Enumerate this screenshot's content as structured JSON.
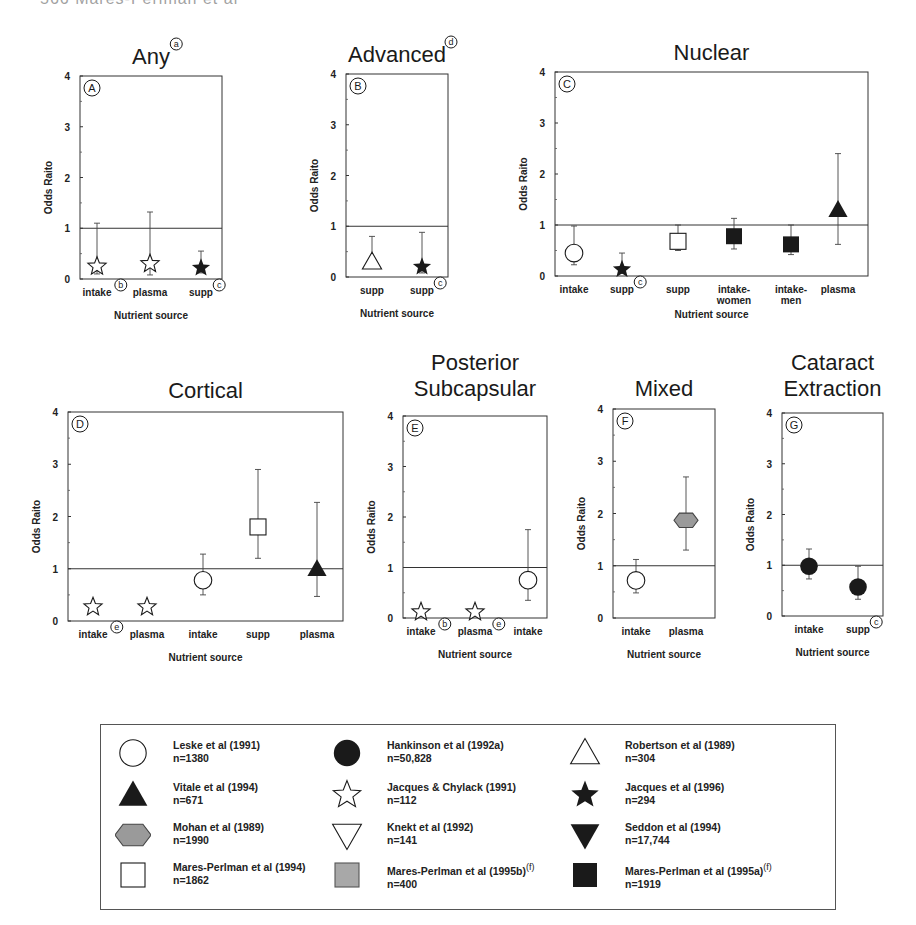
{
  "header": {
    "text": "566          Mares-Perlman et al"
  },
  "axis": {
    "ylabel": "Odds Raito",
    "xlabel": "Nutrient source",
    "yticks": [
      0,
      1,
      2,
      3,
      4
    ],
    "reference_line": 1
  },
  "colors": {
    "ink": "#1a1a1a",
    "hexagon_fill": "#9a9a9a",
    "gray_square_fill": "#a8a8a8"
  },
  "panels": [
    {
      "id": "A",
      "title": "Any",
      "title_note": "a",
      "frame": [
        80,
        76,
        222,
        279
      ],
      "show_xlabel": true,
      "points": [
        {
          "x": 97,
          "label": "intake",
          "label_note": "b",
          "marker": "star-open",
          "or": 0.25,
          "lo": 0.1,
          "hi": 1.1
        },
        {
          "x": 150,
          "label": "plasma",
          "marker": "star-open",
          "or": 0.3,
          "lo": 0.08,
          "hi": 1.32
        },
        {
          "x": 201,
          "label": "supp",
          "label_note": "c",
          "marker": "star-filled",
          "or": 0.22,
          "lo": 0.12,
          "hi": 0.55
        }
      ]
    },
    {
      "id": "B",
      "title": "Advanced",
      "title_note": "d",
      "frame": [
        346,
        74,
        448,
        277
      ],
      "show_xlabel": true,
      "points": [
        {
          "x": 372,
          "label": "supp",
          "marker": "triangle-open",
          "or": 0.3,
          "lo": 0.25,
          "hi": 0.8
        },
        {
          "x": 422,
          "label": "supp",
          "label_note": "c",
          "marker": "star-filled",
          "or": 0.2,
          "lo": 0.08,
          "hi": 0.88
        }
      ]
    },
    {
      "id": "C",
      "title": "Nuclear",
      "title_note": "",
      "frame": [
        555,
        72,
        868,
        276
      ],
      "show_xlabel": true,
      "points": [
        {
          "x": 574,
          "label": "intake",
          "marker": "circle-open",
          "or": 0.45,
          "lo": 0.22,
          "hi": 0.98
        },
        {
          "x": 622,
          "label": "supp",
          "label_note": "c",
          "marker": "star-filled",
          "or": 0.13,
          "lo": 0.05,
          "hi": 0.45
        },
        {
          "x": 678,
          "label": "supp",
          "marker": "square-open",
          "or": 0.68,
          "lo": 0.5,
          "hi": 1.0
        },
        {
          "x": 734,
          "label": "intake-women",
          "marker": "square-filled",
          "or": 0.78,
          "lo": 0.53,
          "hi": 1.13
        },
        {
          "x": 791,
          "label": "intake-men",
          "marker": "square-filled",
          "or": 0.62,
          "lo": 0.42,
          "hi": 1.0
        },
        {
          "x": 838,
          "label": "plasma",
          "marker": "triangle-filled",
          "or": 1.3,
          "lo": 0.62,
          "hi": 2.4
        }
      ]
    },
    {
      "id": "D",
      "title": "Cortical",
      "title_note": "",
      "frame": [
        68,
        412,
        343,
        621
      ],
      "show_xlabel": true,
      "points": [
        {
          "x": 93,
          "label": "intake",
          "label_note": "e",
          "marker": "star-open",
          "or": 0.27,
          "lo": null,
          "hi": null
        },
        {
          "x": 147,
          "label": "plasma",
          "marker": "star-open",
          "or": 0.27,
          "lo": null,
          "hi": null
        },
        {
          "x": 203,
          "label": "intake",
          "marker": "circle-open",
          "or": 0.78,
          "lo": 0.5,
          "hi": 1.28
        },
        {
          "x": 258,
          "label": "supp",
          "marker": "square-open",
          "or": 1.8,
          "lo": 1.2,
          "hi": 2.9
        },
        {
          "x": 317,
          "label": "plasma",
          "marker": "triangle-filled",
          "or": 1.0,
          "lo": 0.47,
          "hi": 2.27
        }
      ]
    },
    {
      "id": "E",
      "title": "Posterior Subcapsular",
      "title_note": "",
      "frame": [
        403,
        416,
        547,
        618
      ],
      "show_xlabel": true,
      "points": [
        {
          "x": 421,
          "label": "intake",
          "label_note": "b",
          "marker": "star-open",
          "or": 0.12,
          "lo": null,
          "hi": null
        },
        {
          "x": 475,
          "label": "plasma",
          "label_note": "e",
          "marker": "star-open",
          "or": 0.12,
          "lo": null,
          "hi": null
        },
        {
          "x": 528,
          "label": "intake",
          "marker": "circle-open",
          "or": 0.75,
          "lo": 0.35,
          "hi": 1.75
        }
      ]
    },
    {
      "id": "F",
      "title": "Mixed",
      "title_note": "",
      "frame": [
        613,
        409,
        715,
        618
      ],
      "show_xlabel": true,
      "points": [
        {
          "x": 636,
          "label": "intake",
          "marker": "circle-open",
          "or": 0.72,
          "lo": 0.48,
          "hi": 1.12
        },
        {
          "x": 686,
          "label": "plasma",
          "marker": "hexagon-gray",
          "or": 1.87,
          "lo": 1.3,
          "hi": 2.7
        }
      ]
    },
    {
      "id": "G",
      "title": "Cataract Extraction",
      "title_note": "",
      "frame": [
        782,
        413,
        883,
        616
      ],
      "show_xlabel": true,
      "points": [
        {
          "x": 809,
          "label": "intake",
          "marker": "circle-filled",
          "or": 0.98,
          "lo": 0.73,
          "hi": 1.32
        },
        {
          "x": 858,
          "label": "supp",
          "label_note": "c",
          "marker": "circle-filled",
          "or": 0.57,
          "lo": 0.33,
          "hi": 0.98
        }
      ]
    }
  ],
  "legend": {
    "items": [
      {
        "marker": "circle-open",
        "name": "Leske et al (1991)",
        "n": "n=1380",
        "note": ""
      },
      {
        "marker": "triangle-filled",
        "name": "Vitale et al (1994)",
        "n": "n=671",
        "note": ""
      },
      {
        "marker": "hexagon-gray",
        "name": "Mohan et al (1989)",
        "n": "n=1990",
        "note": ""
      },
      {
        "marker": "square-open",
        "name": "Mares-Perlman et al (1994)",
        "n": "n=1862",
        "note": ""
      },
      {
        "marker": "circle-filled",
        "name": "Hankinson et al (1992a)",
        "n": "n=50,828",
        "note": ""
      },
      {
        "marker": "star-open",
        "name": "Jacques & Chylack (1991)",
        "n": "n=112",
        "note": ""
      },
      {
        "marker": "triangle-down-open",
        "name": "Knekt et al (1992)",
        "n": "n=141",
        "note": ""
      },
      {
        "marker": "square-gray",
        "name": "Mares-Perlman et al (1995b)",
        "n": "n=400",
        "note": "f"
      },
      {
        "marker": "triangle-open",
        "name": "Robertson et al (1989)",
        "n": "n=304",
        "note": ""
      },
      {
        "marker": "star-filled",
        "name": "Jacques et al (1996)",
        "n": "n=294",
        "note": ""
      },
      {
        "marker": "triangle-down-filled",
        "name": "Seddon et al (1994)",
        "n": "n=17,744",
        "note": ""
      },
      {
        "marker": "square-filled",
        "name": "Mares-Perlman et al (1995a)",
        "n": "n=1919",
        "note": "f"
      }
    ]
  },
  "chart_data": {
    "type": "scatter",
    "ylabel": "Odds Raito",
    "xlabel": "Nutrient source",
    "ylim": [
      0,
      4
    ],
    "reference_line": 1,
    "panels": [
      {
        "panel": "A",
        "title": "Any",
        "categories": [
          "intake",
          "plasma",
          "supp"
        ],
        "values": [
          0.25,
          0.3,
          0.22
        ],
        "ci_low": [
          0.1,
          0.08,
          0.12
        ],
        "ci_high": [
          1.1,
          1.32,
          0.55
        ],
        "studies": [
          "Jacques & Chylack (1991)",
          "Jacques & Chylack (1991)",
          "Jacques et al (1996)"
        ]
      },
      {
        "panel": "B",
        "title": "Advanced",
        "categories": [
          "supp",
          "supp"
        ],
        "values": [
          0.3,
          0.2
        ],
        "ci_low": [
          0.25,
          0.08
        ],
        "ci_high": [
          0.8,
          0.88
        ],
        "studies": [
          "Robertson et al (1989)",
          "Jacques et al (1996)"
        ]
      },
      {
        "panel": "C",
        "title": "Nuclear",
        "categories": [
          "intake",
          "supp",
          "supp",
          "intake-women",
          "intake-men",
          "plasma"
        ],
        "values": [
          0.45,
          0.13,
          0.68,
          0.78,
          0.62,
          1.3
        ],
        "ci_low": [
          0.22,
          0.05,
          0.5,
          0.53,
          0.42,
          0.62
        ],
        "ci_high": [
          0.98,
          0.45,
          1.0,
          1.13,
          1.0,
          2.4
        ],
        "studies": [
          "Leske et al (1991)",
          "Jacques et al (1996)",
          "Mares-Perlman et al (1994)",
          "Mares-Perlman et al (1995a)",
          "Mares-Perlman et al (1995a)",
          "Vitale et al (1994)"
        ]
      },
      {
        "panel": "D",
        "title": "Cortical",
        "categories": [
          "intake",
          "plasma",
          "intake",
          "supp",
          "plasma"
        ],
        "values": [
          0.27,
          0.27,
          0.78,
          1.8,
          1.0
        ],
        "ci_low": [
          null,
          null,
          0.5,
          1.2,
          0.47
        ],
        "ci_high": [
          null,
          null,
          1.28,
          2.9,
          2.27
        ],
        "studies": [
          "Jacques & Chylack (1991)",
          "Jacques & Chylack (1991)",
          "Leske et al (1991)",
          "Mares-Perlman et al (1994)",
          "Vitale et al (1994)"
        ]
      },
      {
        "panel": "E",
        "title": "Posterior Subcapsular",
        "categories": [
          "intake",
          "plasma",
          "intake"
        ],
        "values": [
          0.12,
          0.12,
          0.75
        ],
        "ci_low": [
          null,
          null,
          0.35
        ],
        "ci_high": [
          null,
          null,
          1.75
        ],
        "studies": [
          "Jacques & Chylack (1991)",
          "Jacques & Chylack (1991)",
          "Leske et al (1991)"
        ]
      },
      {
        "panel": "F",
        "title": "Mixed",
        "categories": [
          "intake",
          "plasma"
        ],
        "values": [
          0.72,
          1.87
        ],
        "ci_low": [
          0.48,
          1.3
        ],
        "ci_high": [
          1.12,
          2.7
        ],
        "studies": [
          "Leske et al (1991)",
          "Mohan et al (1989)"
        ]
      },
      {
        "panel": "G",
        "title": "Cataract Extraction",
        "categories": [
          "intake",
          "supp"
        ],
        "values": [
          0.98,
          0.57
        ],
        "ci_low": [
          0.73,
          0.33
        ],
        "ci_high": [
          1.32,
          0.98
        ],
        "studies": [
          "Hankinson et al (1992a)",
          "Hankinson et al (1992a)"
        ]
      }
    ],
    "grid": false,
    "legend_position": "bottom"
  }
}
